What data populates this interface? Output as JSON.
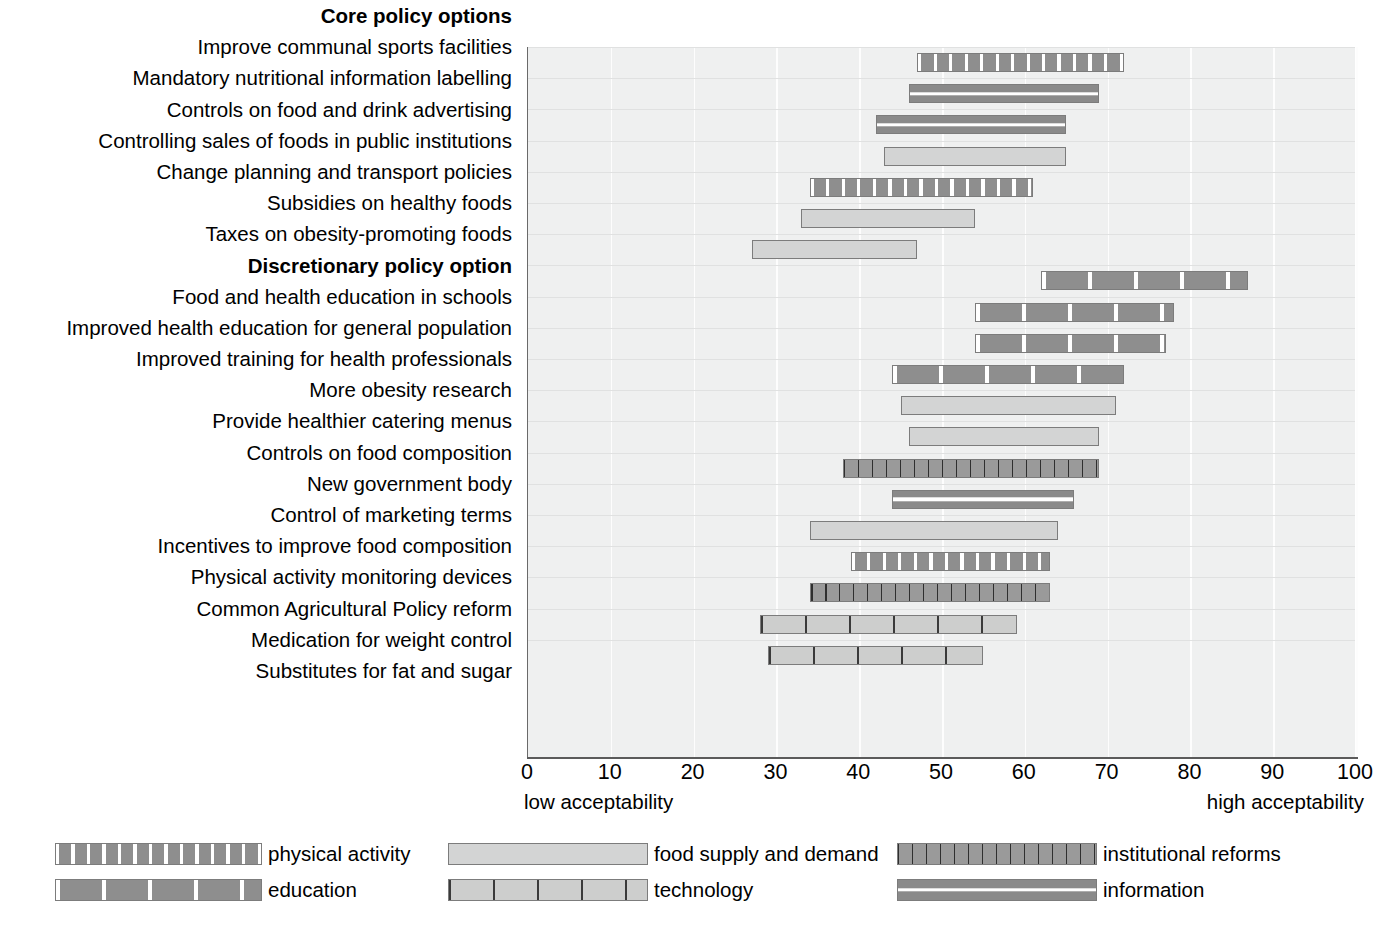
{
  "axis": {
    "ticks": [
      0,
      10,
      20,
      30,
      40,
      50,
      60,
      70,
      80,
      90,
      100
    ],
    "low_label": "low acceptability",
    "high_label": "high acceptability",
    "xmin": 0,
    "xmax": 100
  },
  "section_headers": {
    "core": "Core policy options",
    "discretionary": "Discretionary policy option"
  },
  "legend": {
    "columns": [
      [
        {
          "label": "physical activity",
          "key": "physical"
        },
        {
          "label": "education",
          "key": "education"
        }
      ],
      [
        {
          "label": "food supply and demand",
          "key": "foodsupply"
        },
        {
          "label": "technology",
          "key": "technology"
        }
      ],
      [
        {
          "label": "institutional reforms",
          "key": "institutional"
        },
        {
          "label": "information",
          "key": "information"
        }
      ]
    ]
  },
  "chart_data": {
    "type": "bar",
    "subtype": "floating-range-bar",
    "title": "",
    "xlabel": "",
    "ylabel": "",
    "xlim": [
      0,
      100
    ],
    "grid": true,
    "legend_position": "bottom",
    "axis_annotations": {
      "left": "low acceptability",
      "right": "high acceptability"
    },
    "categories_note": "Each bar spans a low-to-high acceptability range",
    "groups": [
      {
        "header": "Core policy options",
        "rows": [
          {
            "label": "Improve communal sports facilities",
            "low": 47,
            "high": 72,
            "category": "physical activity"
          },
          {
            "label": "Mandatory nutritional information labelling",
            "low": 46,
            "high": 69,
            "category": "information"
          },
          {
            "label": "Controls on food and drink advertising",
            "low": 42,
            "high": 65,
            "category": "information"
          },
          {
            "label": "Controlling sales of foods in public institutions",
            "low": 43,
            "high": 65,
            "category": "food supply and demand"
          },
          {
            "label": "Change planning and transport policies",
            "low": 34,
            "high": 61,
            "category": "physical activity"
          },
          {
            "label": "Subsidies on healthy foods",
            "low": 33,
            "high": 54,
            "category": "food supply and demand"
          },
          {
            "label": "Taxes on obesity-promoting foods",
            "low": 27,
            "high": 47,
            "category": "food supply and demand"
          }
        ]
      },
      {
        "header": "Discretionary policy option",
        "rows": [
          {
            "label": "Food and health education in schools",
            "low": 62,
            "high": 87,
            "category": "education"
          },
          {
            "label": "Improved health education for general population",
            "low": 54,
            "high": 78,
            "category": "education"
          },
          {
            "label": "Improved training for health professionals",
            "low": 54,
            "high": 77,
            "category": "education"
          },
          {
            "label": "More obesity research",
            "low": 44,
            "high": 72,
            "category": "education"
          },
          {
            "label": "Provide healthier catering menus",
            "low": 45,
            "high": 71,
            "category": "food supply and demand"
          },
          {
            "label": "Controls on food composition",
            "low": 46,
            "high": 69,
            "category": "food supply and demand"
          },
          {
            "label": "New government body",
            "low": 38,
            "high": 69,
            "category": "institutional reforms"
          },
          {
            "label": "Control of marketing terms",
            "low": 44,
            "high": 66,
            "category": "information"
          },
          {
            "label": "Incentives to improve food composition",
            "low": 34,
            "high": 64,
            "category": "food supply and demand"
          },
          {
            "label": "Physical activity monitoring devices",
            "low": 39,
            "high": 63,
            "category": "physical activity"
          },
          {
            "label": "Common Agricultural Policy reform",
            "low": 34,
            "high": 63,
            "category": "institutional reforms"
          },
          {
            "label": "Medication for weight control",
            "low": 28,
            "high": 59,
            "category": "technology"
          },
          {
            "label": "Substitutes for fat and sugar",
            "low": 29,
            "high": 55,
            "category": "technology"
          }
        ]
      }
    ]
  }
}
